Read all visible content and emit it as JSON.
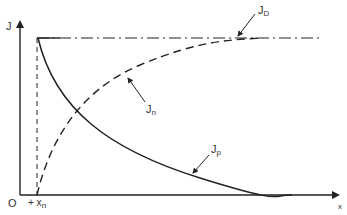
{
  "diagram": {
    "axes": {
      "y_label": "J",
      "x_label": "x",
      "origin_label": "O",
      "x_tick_label": "+ x",
      "x_tick_sub": "n"
    },
    "curves": [
      {
        "name": "J",
        "sub": "D",
        "style": "dash-dot",
        "description": "total current density, constant"
      },
      {
        "name": "J",
        "sub": "n",
        "style": "dashed",
        "description": "electron current density, rising"
      },
      {
        "name": "J",
        "sub": "p",
        "style": "solid",
        "description": "hole current density, decaying"
      }
    ],
    "colors": {
      "line": "#222222",
      "label": "#333333",
      "background": "#ffffff"
    }
  }
}
